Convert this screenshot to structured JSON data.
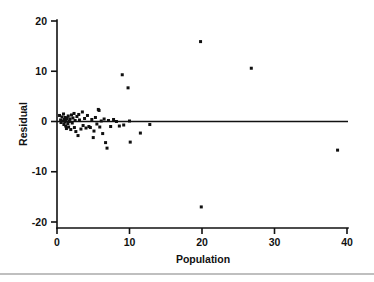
{
  "chart_data": {
    "type": "scatter",
    "title": "",
    "xlabel": "Population",
    "ylabel": "Residual",
    "xlim": [
      0,
      40
    ],
    "ylim": [
      -20,
      20
    ],
    "xticks": [
      0,
      10,
      20,
      30,
      40
    ],
    "yticks": [
      20,
      10,
      0,
      -10,
      -20
    ],
    "xtick_labels": [
      "0",
      "10",
      "20",
      "30",
      "40"
    ],
    "ytick_labels": [
      "20",
      "10",
      "0",
      "-10",
      "-20"
    ],
    "grid": false,
    "legend": null,
    "reference_line": {
      "type": "horizontal",
      "y": 0,
      "label": ""
    },
    "marker": {
      "shape": "square",
      "size": 3,
      "color": "#101010"
    },
    "points": [
      {
        "x": 0.35,
        "y": 1.2
      },
      {
        "x": 0.5,
        "y": 0.3
      },
      {
        "x": 0.55,
        "y": -0.2
      },
      {
        "x": 0.7,
        "y": 0.9
      },
      {
        "x": 0.8,
        "y": 0.1
      },
      {
        "x": 0.9,
        "y": 1.5
      },
      {
        "x": 0.95,
        "y": -0.6
      },
      {
        "x": 1.0,
        "y": 0.4
      },
      {
        "x": 1.1,
        "y": -0.1
      },
      {
        "x": 1.15,
        "y": 0.8
      },
      {
        "x": 1.2,
        "y": -0.9
      },
      {
        "x": 1.25,
        "y": 0.2
      },
      {
        "x": 1.3,
        "y": -1.4
      },
      {
        "x": 1.4,
        "y": 0.6
      },
      {
        "x": 1.5,
        "y": -0.4
      },
      {
        "x": 1.55,
        "y": 1.1
      },
      {
        "x": 1.6,
        "y": -1.1
      },
      {
        "x": 1.7,
        "y": 0.0
      },
      {
        "x": 1.8,
        "y": 0.5
      },
      {
        "x": 1.9,
        "y": -1.6
      },
      {
        "x": 2.0,
        "y": 1.3
      },
      {
        "x": 2.1,
        "y": -0.3
      },
      {
        "x": 2.2,
        "y": 0.7
      },
      {
        "x": 2.35,
        "y": 1.6
      },
      {
        "x": 2.4,
        "y": -1.2
      },
      {
        "x": 2.5,
        "y": 0.2
      },
      {
        "x": 2.6,
        "y": -2.0
      },
      {
        "x": 2.75,
        "y": 1.0
      },
      {
        "x": 2.9,
        "y": -2.8
      },
      {
        "x": 3.0,
        "y": 1.4
      },
      {
        "x": 3.1,
        "y": 0.3
      },
      {
        "x": 3.3,
        "y": -1.5
      },
      {
        "x": 3.5,
        "y": 1.9
      },
      {
        "x": 3.6,
        "y": -0.8
      },
      {
        "x": 3.8,
        "y": 0.6
      },
      {
        "x": 4.0,
        "y": -1.3
      },
      {
        "x": 4.2,
        "y": 1.2
      },
      {
        "x": 4.4,
        "y": -1.0
      },
      {
        "x": 4.6,
        "y": -1.2
      },
      {
        "x": 4.8,
        "y": 0.4
      },
      {
        "x": 5.0,
        "y": -3.2
      },
      {
        "x": 5.1,
        "y": -1.9
      },
      {
        "x": 5.3,
        "y": 0.8
      },
      {
        "x": 5.5,
        "y": -0.5
      },
      {
        "x": 5.7,
        "y": 2.4
      },
      {
        "x": 5.8,
        "y": 2.2
      },
      {
        "x": 5.9,
        "y": -1.1
      },
      {
        "x": 6.1,
        "y": 0.1
      },
      {
        "x": 6.3,
        "y": -2.4
      },
      {
        "x": 6.5,
        "y": 0.5
      },
      {
        "x": 6.7,
        "y": -4.2
      },
      {
        "x": 6.9,
        "y": -5.3
      },
      {
        "x": 7.1,
        "y": 0.2
      },
      {
        "x": 7.4,
        "y": -1.0
      },
      {
        "x": 7.8,
        "y": 0.4
      },
      {
        "x": 8.2,
        "y": 0.0
      },
      {
        "x": 8.6,
        "y": -0.9
      },
      {
        "x": 9.0,
        "y": 9.3
      },
      {
        "x": 9.2,
        "y": -0.7
      },
      {
        "x": 9.8,
        "y": 6.7
      },
      {
        "x": 10.0,
        "y": 0.1
      },
      {
        "x": 10.1,
        "y": -4.1
      },
      {
        "x": 11.5,
        "y": -2.3
      },
      {
        "x": 12.8,
        "y": -0.6
      },
      {
        "x": 19.8,
        "y": 15.9
      },
      {
        "x": 19.9,
        "y": -17.0
      },
      {
        "x": 26.8,
        "y": 10.6
      },
      {
        "x": 38.7,
        "y": -5.7
      }
    ]
  },
  "footer": {
    "rule": true
  }
}
